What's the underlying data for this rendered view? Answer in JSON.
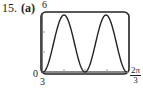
{
  "problem": {
    "number": "15.",
    "part": "(a)"
  },
  "chart_data": {
    "type": "line",
    "title": "",
    "xlabel": "",
    "ylabel": "",
    "xlim_labels": [
      "3",
      "2π/3"
    ],
    "x_left_label": "3",
    "x_right_label": {
      "numerator": "2π",
      "denominator": "3"
    },
    "y_top_label": "6",
    "y_bottom_label": "0",
    "ylim": [
      0,
      6
    ],
    "xlim": [
      0,
      2.0944
    ],
    "grid": false,
    "legend": null,
    "x_ticks": 3,
    "y_ticks": 2,
    "series": [
      {
        "name": "y = 3 - 3cos(6x)",
        "x": [
          0,
          0.1309,
          0.2618,
          0.3927,
          0.5236,
          0.6545,
          0.7854,
          0.9163,
          1.0472,
          1.1781,
          1.309,
          1.4399,
          1.5708,
          1.7017,
          1.8326,
          1.9635,
          2.0944
        ],
        "values": [
          0,
          0.88,
          3,
          5.12,
          6,
          5.12,
          3,
          0.88,
          0,
          0.88,
          3,
          5.12,
          6,
          5.12,
          3,
          0.88,
          0
        ]
      }
    ]
  },
  "colors": {
    "curve": "#222222",
    "frame": "#222222",
    "axis": "#888888"
  }
}
